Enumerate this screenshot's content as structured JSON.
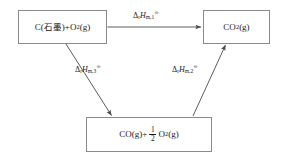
{
  "diagram": {
    "background_color": "#ffffff",
    "line_color": "#8a8a8a",
    "arrow_color": "#4a4a4a",
    "text_color": "#1a1a1a",
    "nodes": [
      {
        "id": "reactants",
        "name": "node-reactants",
        "prefix": "C(",
        "cjk": "石墨",
        "middle": ")+O",
        "sub": "2",
        "suffix": "(g)"
      },
      {
        "id": "product",
        "name": "node-product",
        "prefix": "CO",
        "sub": "2",
        "suffix": "(g)"
      },
      {
        "id": "intermediate",
        "name": "node-intermediate",
        "prefix": "CO(g)+",
        "fraction_numerator": "1",
        "fraction_denominator": "2",
        "after_fraction": "O",
        "sub": "2",
        "suffix": "(g)"
      }
    ],
    "arrows": [
      {
        "id": "arrow-h1",
        "name": "arrow-reactants-to-product",
        "from": "reactants",
        "to": "product",
        "direction": "horizontal-right"
      },
      {
        "id": "arrow-h3",
        "name": "arrow-reactants-to-intermediate",
        "from": "reactants",
        "to": "intermediate",
        "direction": "diagonal-down-right"
      },
      {
        "id": "arrow-h2",
        "name": "arrow-intermediate-to-product",
        "from": "intermediate",
        "to": "product",
        "direction": "diagonal-up-right"
      }
    ],
    "labels": [
      {
        "id": "h1",
        "name": "enthalpy-label-1",
        "delta": "Δ",
        "reaction_sub": "r",
        "symbol": "H",
        "molar_sub": "m,1",
        "standard_state": "⦵"
      },
      {
        "id": "h3",
        "name": "enthalpy-label-3",
        "delta": "Δ",
        "reaction_sub": "r",
        "symbol": "H",
        "molar_sub": "m,3",
        "standard_state": "⦵"
      },
      {
        "id": "h2",
        "name": "enthalpy-label-2",
        "delta": "Δ",
        "reaction_sub": "r",
        "symbol": "H",
        "molar_sub": "m,2",
        "standard_state": "⦵"
      }
    ]
  }
}
